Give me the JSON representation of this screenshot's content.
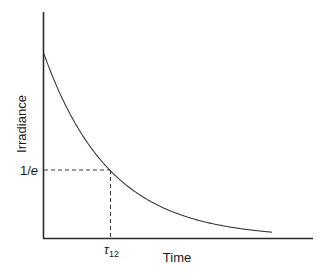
{
  "chart_data": {
    "type": "line",
    "title": "",
    "xlabel": "Time",
    "ylabel": "Irradiance",
    "series": [
      {
        "name": "Irradiance decay",
        "function": "I(t) = I0 * exp(-t / tau12)",
        "x": [
          0,
          0.5,
          1,
          1.5,
          2,
          2.5,
          3,
          3.5
        ],
        "values": [
          1.0,
          0.607,
          0.368,
          0.223,
          0.135,
          0.082,
          0.05,
          0.03
        ]
      }
    ],
    "annotations": [
      {
        "type": "hline-dashed",
        "y_label": "1/e",
        "y": 0.368,
        "from_x": 0,
        "to_x": 1
      },
      {
        "type": "vline-dashed",
        "x_label": "τ12",
        "x": 1,
        "from_y": 0,
        "to_y": 0.368
      }
    ],
    "ytick_labels": [
      "1/e"
    ],
    "xtick_labels": [
      "τ12"
    ],
    "xlim": [
      0,
      4.1
    ],
    "ylim": [
      0,
      1.23
    ],
    "grid": false,
    "legend": null
  },
  "labels": {
    "y_axis": "Irradiance",
    "x_axis": "Time",
    "y_marker_main": "1/",
    "y_marker_italic": "e",
    "x_marker_main": "τ",
    "x_marker_sub": "12"
  },
  "colors": {
    "axis": "#2a2a2a",
    "curve": "#3a3a3a",
    "dash": "#3a3a3a",
    "text": "#1a1a1a"
  }
}
